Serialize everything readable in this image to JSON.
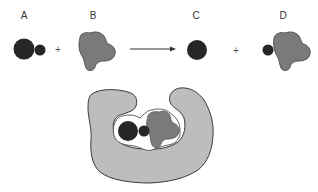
{
  "diagram": {
    "type": "enzyme-substrate reaction",
    "labels": {
      "a": "A",
      "b": "B",
      "c": "C",
      "d": "D"
    },
    "operators": {
      "plus1": "+",
      "plus2": "+"
    },
    "colors": {
      "dark_molecule": "#262626",
      "gray_molecule": "#7a7a7a",
      "enzyme": "#bdbdbd",
      "outline": "#3a3a3a",
      "text": "#333333",
      "background": "#ffffff"
    },
    "elements": [
      {
        "id": "A",
        "description": "dark molecule: large circle with small attached circle"
      },
      {
        "id": "B",
        "description": "gray irregular blob"
      },
      {
        "id": "C",
        "description": "dark single circle"
      },
      {
        "id": "D",
        "description": "gray blob with small dark circle attached"
      },
      {
        "id": "enzyme",
        "description": "light gray U-shaped enzyme holding A and B in active site"
      }
    ]
  }
}
